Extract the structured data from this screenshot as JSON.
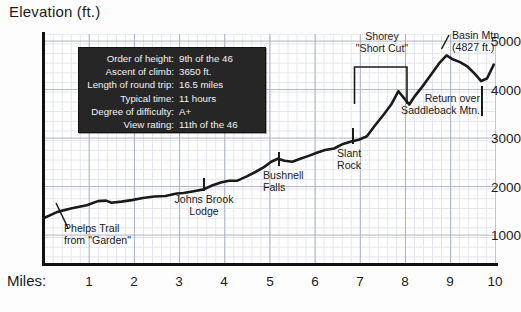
{
  "chart_title": "Elevation (ft.)",
  "axis": {
    "x_axis_name": "Miles:",
    "y_ticks": [
      "5000",
      "4000",
      "3000",
      "2000",
      "1000"
    ],
    "x_ticks": [
      "1",
      "2",
      "3",
      "4",
      "5",
      "6",
      "7",
      "8",
      "9",
      "10"
    ]
  },
  "info_box": {
    "rows": [
      {
        "key": "Order of height:",
        "value": "9th of the 46"
      },
      {
        "key": "Ascent of climb:",
        "value": "3650 ft."
      },
      {
        "key": "Length of round trip:",
        "value": "16.5 miles"
      },
      {
        "key": "Typical time:",
        "value": "11 hours"
      },
      {
        "key": "Degree of difficulty:",
        "value": "A+"
      },
      {
        "key": "View rating:",
        "value": "11th of the 46"
      }
    ]
  },
  "annotations": {
    "phelps_line1": "Phelps Trail",
    "phelps_line2": "from \"Garden\"",
    "jbl_line1": "Johns Brook",
    "jbl_line2": "Lodge",
    "bushnell_line1": "Bushnell",
    "bushnell_line2": "Falls",
    "slant_line1": "Slant",
    "slant_line2": "Rock",
    "shorey_line1": "Shorey",
    "shorey_line2": "\"Short Cut\"",
    "basin_line1": "Basin Mtn.",
    "basin_line2": "(4827 ft.)",
    "return_line1": "Return over",
    "return_line2": "Saddleback Mtn."
  },
  "colors": {
    "curve": "#1a1a1a",
    "grid_minor": "#d9dde8",
    "grid_major": "#9aa2b4",
    "info_bg": "#262626",
    "info_text": "#f4f4f4"
  },
  "chart_data": {
    "type": "line",
    "title": "Elevation (ft.)",
    "xlabel": "Miles:",
    "ylabel": "Elevation (ft.)",
    "xlim": [
      0,
      10.05
    ],
    "ylim": [
      700,
      5200
    ],
    "grid": true,
    "legend": "none",
    "series": [
      {
        "name": "Trail elevation profile (Phelps Trail to Basin Mtn.)",
        "x": [
          0.0,
          0.3,
          0.62,
          0.95,
          1.2,
          1.38,
          1.5,
          1.72,
          1.95,
          2.2,
          2.45,
          2.7,
          2.95,
          3.1,
          3.3,
          3.55,
          3.75,
          3.95,
          4.12,
          4.3,
          4.52,
          4.7,
          4.9,
          5.05,
          5.2,
          5.35,
          5.52,
          5.7,
          5.9,
          6.05,
          6.25,
          6.45,
          6.65,
          6.85,
          7.0,
          7.18,
          7.35,
          7.55,
          7.72,
          7.88,
          8.0,
          8.12,
          8.25,
          8.42,
          8.6,
          8.78,
          8.95,
          9.1,
          9.25,
          9.42,
          9.58,
          9.72,
          9.85,
          10.0
        ],
        "y": [
          1600,
          1720,
          1790,
          1850,
          1930,
          1940,
          1900,
          1920,
          1950,
          1990,
          2020,
          2030,
          2080,
          2090,
          2120,
          2160,
          2240,
          2300,
          2330,
          2330,
          2420,
          2500,
          2600,
          2700,
          2760,
          2720,
          2700,
          2760,
          2820,
          2870,
          2930,
          2960,
          3050,
          3100,
          3130,
          3200,
          3400,
          3620,
          3820,
          4080,
          3950,
          3820,
          3990,
          4180,
          4400,
          4620,
          4780,
          4700,
          4650,
          4560,
          4420,
          4280,
          4330,
          4600
        ]
      }
    ],
    "points_of_interest": [
      {
        "label": "Phelps Trail from \"Garden\"",
        "mile": 0.0,
        "elevation_ft": 1600
      },
      {
        "label": "Johns Brook Lodge",
        "mile": 3.55,
        "elevation_ft": 2160
      },
      {
        "label": "Bushnell Falls",
        "mile": 5.2,
        "elevation_ft": 2760
      },
      {
        "label": "Slant Rock",
        "mile": 6.9,
        "elevation_ft": 3100
      },
      {
        "label": "Shorey \"Short Cut\"",
        "mile_start": 7.0,
        "mile_end": 8.15
      },
      {
        "label": "Basin Mtn.",
        "mile": 8.95,
        "elevation_ft": 4827
      },
      {
        "label": "Return over Saddleback Mtn.",
        "mile": 9.75,
        "elevation_ft": 4400
      }
    ]
  }
}
